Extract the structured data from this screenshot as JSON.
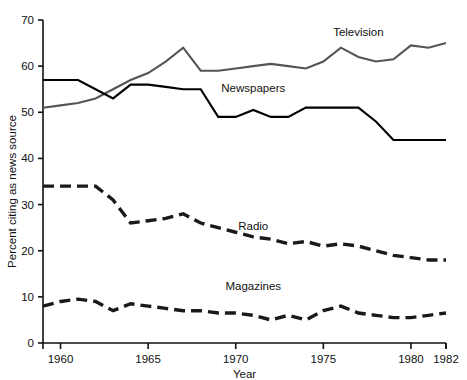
{
  "chart_data": {
    "type": "line",
    "title": "",
    "xlabel": "Year",
    "ylabel": "Percent citing as news source",
    "xlim": [
      1959,
      1982
    ],
    "ylim": [
      0,
      70
    ],
    "grid": false,
    "legend_position": "inline-labels",
    "x_ticks": [
      1960,
      1965,
      1970,
      1975,
      1980,
      1982
    ],
    "x_tick_labels": [
      "1960",
      "1965",
      "1970",
      "1975",
      "1980",
      "1982"
    ],
    "y_ticks": [
      0,
      10,
      20,
      30,
      40,
      50,
      60,
      70
    ],
    "y_tick_labels": [
      "0",
      "10",
      "20",
      "30",
      "40",
      "50",
      "60",
      "70"
    ],
    "x": [
      1959,
      1960,
      1961,
      1962,
      1963,
      1964,
      1965,
      1966,
      1967,
      1968,
      1969,
      1970,
      1971,
      1972,
      1973,
      1974,
      1975,
      1976,
      1977,
      1978,
      1979,
      1980,
      1981,
      1982
    ],
    "series": [
      {
        "name": "Television",
        "color": "#555555",
        "style": "solid",
        "label_x": 1977,
        "label_y": 66.5,
        "values": [
          51,
          51.5,
          52,
          53,
          55,
          57,
          58.5,
          61,
          64,
          59,
          59,
          59.5,
          60,
          60.5,
          60,
          59.5,
          61,
          64,
          62,
          61,
          61.5,
          64.5,
          64,
          65
        ]
      },
      {
        "name": "Newspapers",
        "color": "#000000",
        "style": "solid",
        "label_x": 1971,
        "label_y": 54.5,
        "values": [
          57,
          57,
          57,
          55,
          53,
          56,
          56,
          55.5,
          55,
          55,
          49,
          49,
          50.5,
          49,
          49,
          51,
          51,
          51,
          51,
          48,
          44,
          44,
          44,
          44
        ]
      },
      {
        "name": "Radio",
        "color": "#1a1a1a",
        "style": "dashed",
        "label_x": 1971,
        "label_y": 24.5,
        "values": [
          34,
          34,
          34,
          34,
          31,
          26,
          26.5,
          27,
          28,
          26,
          25,
          24,
          23,
          22.5,
          21.5,
          22,
          21,
          21.5,
          21,
          20,
          19,
          18.5,
          18,
          18
        ]
      },
      {
        "name": "Magazines",
        "color": "#1a1a1a",
        "style": "dashed",
        "label_x": 1971,
        "label_y": 11.5,
        "values": [
          8,
          9,
          9.5,
          9,
          7,
          8.5,
          8,
          7.5,
          7,
          7,
          6.5,
          6.5,
          6,
          5,
          6,
          5,
          7,
          8,
          6.5,
          6,
          5.5,
          5.5,
          6,
          6.5
        ]
      }
    ]
  }
}
